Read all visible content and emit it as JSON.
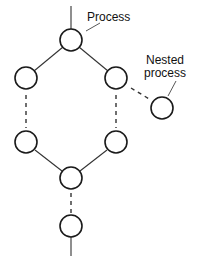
{
  "diagram": {
    "labels": {
      "process": "Process",
      "nested_line1": "Nested",
      "nested_line2": "process"
    },
    "nodes": [
      {
        "id": "top",
        "cx": 71,
        "cy": 40
      },
      {
        "id": "left-upper",
        "cx": 26,
        "cy": 78
      },
      {
        "id": "right-upper",
        "cx": 116,
        "cy": 78
      },
      {
        "id": "nested",
        "cx": 162,
        "cy": 108
      },
      {
        "id": "left-lower",
        "cx": 26,
        "cy": 142
      },
      {
        "id": "right-lower",
        "cx": 116,
        "cy": 142
      },
      {
        "id": "join",
        "cx": 71,
        "cy": 178
      },
      {
        "id": "final",
        "cx": 71,
        "cy": 226
      }
    ],
    "edges": [
      {
        "from": "top",
        "to": "left-upper",
        "style": "solid"
      },
      {
        "from": "top",
        "to": "right-upper",
        "style": "solid"
      },
      {
        "from": "left-upper",
        "to": "left-lower",
        "style": "dashed"
      },
      {
        "from": "right-upper",
        "to": "right-lower",
        "style": "dashed"
      },
      {
        "from": "right-upper",
        "to": "nested",
        "style": "dashed"
      },
      {
        "from": "left-lower",
        "to": "join",
        "style": "solid"
      },
      {
        "from": "right-lower",
        "to": "join",
        "style": "solid"
      },
      {
        "from": "join",
        "to": "final",
        "style": "dashed"
      }
    ]
  }
}
